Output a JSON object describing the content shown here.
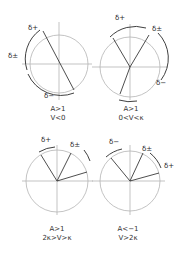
{
  "figure": {
    "panels": [
      {
        "id": "panel-1",
        "condition_line1": "A>1",
        "condition_line2": "V<0",
        "labels": {
          "a": "δ+",
          "b": "δ±",
          "c": "δ−"
        }
      },
      {
        "id": "panel-2",
        "condition_line1": "A>1",
        "condition_line2": "0<V<κ",
        "labels": {
          "a": "δ+",
          "b": "δ±",
          "c": "δ−"
        }
      },
      {
        "id": "panel-3",
        "condition_line1": "A>1",
        "condition_line2": "2κ>V>κ",
        "labels": {
          "a": "δ+",
          "b": "δ±"
        }
      },
      {
        "id": "panel-4",
        "condition_line1": "A<−1",
        "condition_line2": "V>2κ",
        "labels": {
          "a": "δ−",
          "b": "δ±",
          "c": "δ+"
        }
      }
    ]
  }
}
